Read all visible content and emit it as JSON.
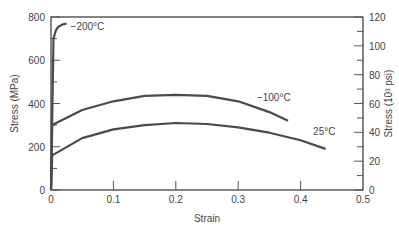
{
  "chart_data": {
    "type": "line",
    "title": "",
    "xlabel": "Strain",
    "ylabel": "Stress (MPa)",
    "ylabel_right": "Stress (10³ psi)",
    "xlim": [
      0,
      0.5
    ],
    "ylim": [
      0,
      800
    ],
    "ylim_right": [
      0,
      120
    ],
    "x_ticks": [
      "0",
      "0.1",
      "0.2",
      "0.3",
      "0.4",
      "0.5"
    ],
    "y_ticks": [
      "0",
      "200",
      "400",
      "600",
      "800"
    ],
    "y_ticks_right": [
      "0",
      "20",
      "40",
      "60",
      "80",
      "100",
      "120"
    ],
    "grid": false,
    "legend": "inline labels",
    "series": [
      {
        "name": "−200°C",
        "label": "−200°C",
        "x": [
          0,
          0.004,
          0.006,
          0.008,
          0.012,
          0.018,
          0.025
        ],
        "y": [
          0,
          700,
          720,
          740,
          755,
          765,
          770
        ]
      },
      {
        "name": "−100°C",
        "label": "−100°C",
        "x": [
          0,
          0.002,
          0.05,
          0.1,
          0.15,
          0.2,
          0.25,
          0.3,
          0.35,
          0.38
        ],
        "y": [
          0,
          300,
          370,
          410,
          435,
          440,
          435,
          410,
          360,
          320
        ]
      },
      {
        "name": "25°C",
        "label": "25°C",
        "x": [
          0,
          0.002,
          0.05,
          0.1,
          0.15,
          0.2,
          0.25,
          0.3,
          0.35,
          0.4,
          0.44
        ],
        "y": [
          0,
          160,
          240,
          280,
          300,
          310,
          305,
          290,
          265,
          230,
          190
        ]
      }
    ]
  }
}
